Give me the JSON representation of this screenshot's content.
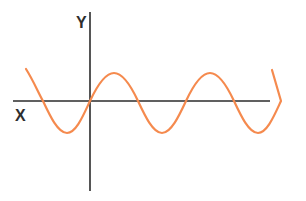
{
  "diagram": {
    "type": "wave-anatomy",
    "axes": {
      "x_label": "X",
      "y_label": "Y"
    },
    "labels": {
      "amplitude": "AMPLITUDE",
      "peak": "PEAK",
      "trough": "TROUGH",
      "period": "PERIOD"
    },
    "colors": {
      "wave": "#F58A4E",
      "axes": "#2b2b2b",
      "text": "#2e2e2e",
      "background": "#ffffff"
    }
  }
}
